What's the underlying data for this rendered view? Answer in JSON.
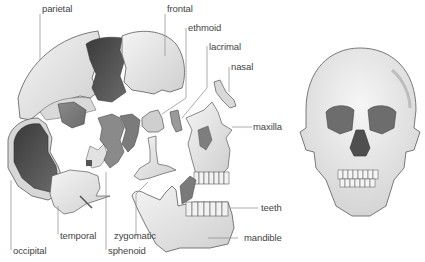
{
  "diagram": {
    "views": [
      "exploded-lateral",
      "frontal"
    ],
    "colors": {
      "bone_light": "#e4e4e4",
      "bone_mid": "#c9c9c9",
      "bone_dark": "#7a7a7a",
      "bone_darkest": "#474747",
      "outline": "#5a5a5a",
      "leader_line": "#888888",
      "label_text": "#444444"
    },
    "labels": {
      "parietal": "parietal",
      "frontal": "frontal",
      "ethmoid": "ethmoid",
      "lacrimal": "lacrimal",
      "nasal": "nasal",
      "maxilla": "maxilla",
      "teeth": "teeth",
      "mandible": "mandible",
      "zygomatic": "zygomatic",
      "sphenoid": "sphenoid",
      "temporal": "temporal",
      "occipital": "occipital"
    }
  }
}
